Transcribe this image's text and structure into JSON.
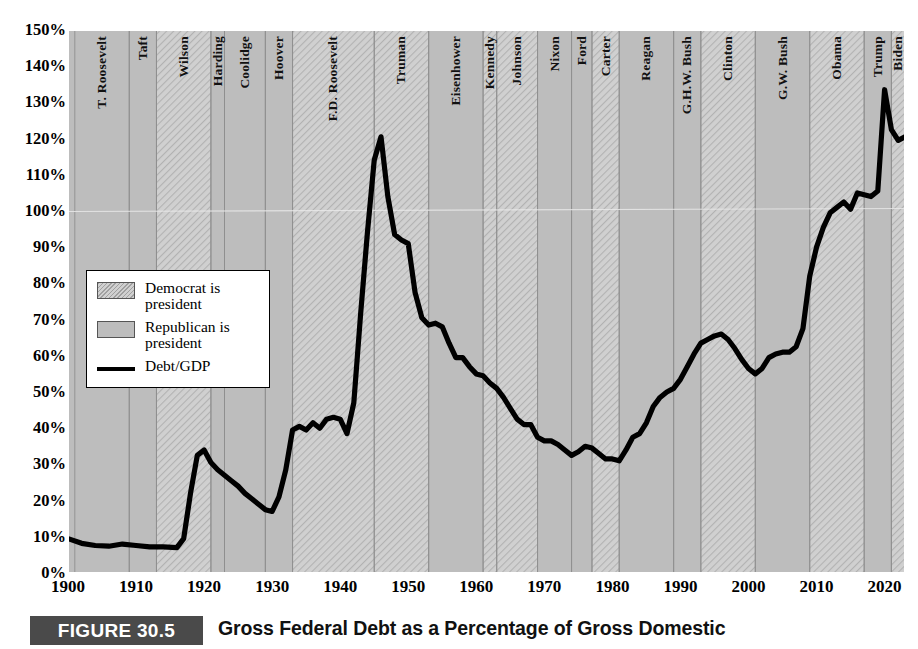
{
  "figure": {
    "number_label": "FIGURE 30.5",
    "title": "Gross Federal Debt as a Percentage of Gross Domestic"
  },
  "legend": {
    "items": [
      {
        "swatch": "democrat-swatch",
        "label": "Democrat is president"
      },
      {
        "swatch": "republican-swatch",
        "label": "Republican is president"
      },
      {
        "swatch": "debt-line-swatch",
        "label": "Debt/GDP"
      }
    ]
  },
  "colors": {
    "plot_background": "#c2c2c2",
    "republican_band": "#bdbdbd",
    "democrat_band": "#d0d0d0",
    "line": "#000000",
    "caption_bar": "#4a4a4a",
    "gridline": "#9a9a9a"
  },
  "chart_data": {
    "type": "line",
    "title": "Gross Federal Debt as a Percentage of Gross Domestic",
    "xlabel": "",
    "ylabel": "",
    "xlim": [
      1900,
      2023
    ],
    "ylim": [
      0,
      150
    ],
    "grid": true,
    "legend_position": "inside-left",
    "y_ticks": [
      "0%",
      "10%",
      "20%",
      "30%",
      "40%",
      "50%",
      "60%",
      "70%",
      "80%",
      "90%",
      "100%",
      "110%",
      "120%",
      "130%",
      "140%",
      "150%"
    ],
    "y_tick_values": [
      0,
      10,
      20,
      30,
      40,
      50,
      60,
      70,
      80,
      90,
      100,
      110,
      120,
      130,
      140,
      150
    ],
    "x_ticks": [
      "1900",
      "1910",
      "1920",
      "1930",
      "1940",
      "1950",
      "1960",
      "1970",
      "1980",
      "1990",
      "2000",
      "2010",
      "2020"
    ],
    "x_tick_values": [
      1900,
      1910,
      1920,
      1930,
      1940,
      1950,
      1960,
      1970,
      1980,
      1990,
      2000,
      2010,
      2020
    ],
    "series": [
      {
        "name": "Debt/GDP",
        "x": [
          1900,
          1902,
          1904,
          1906,
          1908,
          1910,
          1912,
          1914,
          1916,
          1917,
          1918,
          1919,
          1920,
          1921,
          1922,
          1923,
          1924,
          1925,
          1926,
          1927,
          1928,
          1929,
          1930,
          1931,
          1932,
          1933,
          1934,
          1935,
          1936,
          1937,
          1938,
          1939,
          1940,
          1941,
          1942,
          1943,
          1944,
          1945,
          1946,
          1947,
          1948,
          1949,
          1950,
          1951,
          1952,
          1953,
          1954,
          1955,
          1956,
          1957,
          1958,
          1959,
          1960,
          1961,
          1962,
          1963,
          1964,
          1965,
          1966,
          1967,
          1968,
          1969,
          1970,
          1971,
          1972,
          1973,
          1974,
          1975,
          1976,
          1977,
          1978,
          1979,
          1980,
          1981,
          1982,
          1983,
          1984,
          1985,
          1986,
          1987,
          1988,
          1989,
          1990,
          1991,
          1992,
          1993,
          1994,
          1995,
          1996,
          1997,
          1998,
          1999,
          2000,
          2001,
          2002,
          2003,
          2004,
          2005,
          2006,
          2007,
          2008,
          2009,
          2010,
          2011,
          2012,
          2013,
          2014,
          2015,
          2016,
          2017,
          2018,
          2019,
          2020,
          2021,
          2022,
          2023
        ],
        "y": [
          9.5,
          8.2,
          7.6,
          7.4,
          8.0,
          7.6,
          7.2,
          7.2,
          7.0,
          9.5,
          22.0,
          32.5,
          34.0,
          30.5,
          28.5,
          27.0,
          25.5,
          24.0,
          22.0,
          20.5,
          19.0,
          17.5,
          17.0,
          21.0,
          28.5,
          39.5,
          40.5,
          39.5,
          41.5,
          40.0,
          42.5,
          43.0,
          42.5,
          38.5,
          47.0,
          71.5,
          94.0,
          114.0,
          120.5,
          104.0,
          93.5,
          92.0,
          91.0,
          77.5,
          70.5,
          68.5,
          69.0,
          68.0,
          63.5,
          59.5,
          59.5,
          57.0,
          55.0,
          54.5,
          52.5,
          51.0,
          48.5,
          45.5,
          42.5,
          41.0,
          41.0,
          37.5,
          36.5,
          36.5,
          35.5,
          34.0,
          32.5,
          33.5,
          35.0,
          34.5,
          33.0,
          31.5,
          31.5,
          31.0,
          34.0,
          37.5,
          38.5,
          41.5,
          46.0,
          48.5,
          50.0,
          51.0,
          53.5,
          57.0,
          60.5,
          63.5,
          64.5,
          65.5,
          66.0,
          64.5,
          62.0,
          59.0,
          56.5,
          55.0,
          56.5,
          59.5,
          60.5,
          61.0,
          61.0,
          62.5,
          67.5,
          82.0,
          90.0,
          95.5,
          99.5,
          101.0,
          102.5,
          100.5,
          105.0,
          104.5,
          104.0,
          105.5,
          133.5,
          122.5,
          119.5,
          120.5
        ]
      }
    ],
    "annotations": [
      {
        "label": "peak WWII debt",
        "x": 1946,
        "y": 120.5
      },
      {
        "label": "postwar low",
        "x": 1974,
        "y": 32.5
      },
      {
        "label": "1981 low",
        "x": 1981,
        "y": 31.0
      },
      {
        "label": "COVID spike",
        "x": 2020,
        "y": 133.5
      }
    ],
    "presidential_terms": [
      {
        "name": "T.\nRoosevelt",
        "label": "T. Roosevelt",
        "party": "Republican",
        "start": 1901,
        "end": 1909
      },
      {
        "name": "Taft",
        "label": "Taft",
        "party": "Republican",
        "start": 1909,
        "end": 1913
      },
      {
        "name": "Wilson",
        "label": "Wilson",
        "party": "Democrat",
        "start": 1913,
        "end": 1921
      },
      {
        "name": "Harding",
        "label": "Harding",
        "party": "Republican",
        "start": 1921,
        "end": 1923
      },
      {
        "name": "Coolidge",
        "label": "Coolidge",
        "party": "Republican",
        "start": 1923,
        "end": 1929
      },
      {
        "name": "Hoover",
        "label": "Hoover",
        "party": "Republican",
        "start": 1929,
        "end": 1933
      },
      {
        "name": "F.D.\nRoosevelt",
        "label": "F.D. Roosevelt",
        "party": "Democrat",
        "start": 1933,
        "end": 1945
      },
      {
        "name": "Truman",
        "label": "Truman",
        "party": "Democrat",
        "start": 1945,
        "end": 1953
      },
      {
        "name": "Eisenhower",
        "label": "Eisenhower",
        "party": "Republican",
        "start": 1953,
        "end": 1961
      },
      {
        "name": "Kennedy",
        "label": "Kennedy",
        "party": "Democrat",
        "start": 1961,
        "end": 1963
      },
      {
        "name": "Johnson",
        "label": "Johnson",
        "party": "Democrat",
        "start": 1963,
        "end": 1969
      },
      {
        "name": "Nixon",
        "label": "Nixon",
        "party": "Republican",
        "start": 1969,
        "end": 1974
      },
      {
        "name": "Ford",
        "label": "Ford",
        "party": "Republican",
        "start": 1974,
        "end": 1977
      },
      {
        "name": "Carter",
        "label": "Carter",
        "party": "Democrat",
        "start": 1977,
        "end": 1981
      },
      {
        "name": "Reagan",
        "label": "Reagan",
        "party": "Republican",
        "start": 1981,
        "end": 1989
      },
      {
        "name": "G.H.W.\nBush",
        "label": "G.H.W. Bush",
        "party": "Republican",
        "start": 1989,
        "end": 1993
      },
      {
        "name": "Clinton",
        "label": "Clinton",
        "party": "Democrat",
        "start": 1993,
        "end": 2001
      },
      {
        "name": "G.W.\nBush",
        "label": "G.W. Bush",
        "party": "Republican",
        "start": 2001,
        "end": 2009
      },
      {
        "name": "Obama",
        "label": "Obama",
        "party": "Democrat",
        "start": 2009,
        "end": 2017
      },
      {
        "name": "Trump",
        "label": "Trump",
        "party": "Republican",
        "start": 2017,
        "end": 2021
      },
      {
        "name": "Biden",
        "label": "Biden",
        "party": "Democrat",
        "start": 2021,
        "end": 2023
      }
    ]
  }
}
